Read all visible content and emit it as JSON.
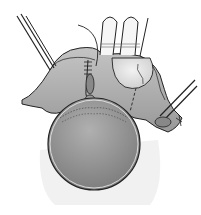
{
  "figure": {
    "type": "surgical-illustration",
    "style": "grayscale line drawing with shading",
    "elements": [
      "left-forceps",
      "right-forceps",
      "retractor-blades",
      "suture-line",
      "tissue-flap",
      "incision-line-dashed",
      "spherical-organ",
      "suture-thread"
    ]
  },
  "colors": {
    "background": "#ffffff",
    "tissue": "#a8a8a8",
    "tissue_dark": "#8a8a8a",
    "tissue_light": "#c8c8c8",
    "sphere": "#9a9a9a",
    "outline": "#222222",
    "flap": "#e6e6e6",
    "instrument": "#f4f4f4"
  }
}
